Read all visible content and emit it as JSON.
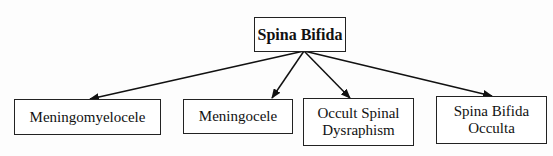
{
  "diagram": {
    "root": {
      "label": "Spina Bifida"
    },
    "children": [
      {
        "label": "Meningomyelocele"
      },
      {
        "label": "Meningocele"
      },
      {
        "label": "Occult Spinal Dysraphism"
      },
      {
        "label": "Spina Bifida Occulta"
      }
    ],
    "edges": [
      {
        "from": "Spina Bifida",
        "to": "Meningomyelocele"
      },
      {
        "from": "Spina Bifida",
        "to": "Meningocele"
      },
      {
        "from": "Spina Bifida",
        "to": "Occult Spinal Dysraphism"
      },
      {
        "from": "Spina Bifida",
        "to": "Spina Bifida Occulta"
      }
    ]
  }
}
